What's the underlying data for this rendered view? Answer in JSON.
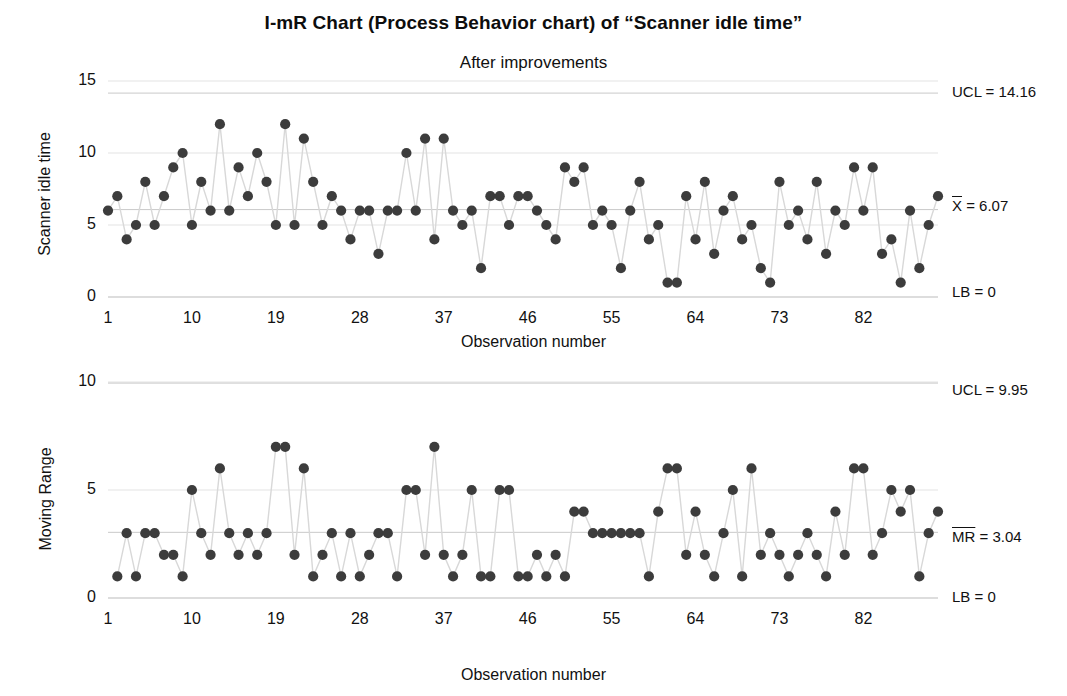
{
  "chart_title": "I-mR Chart (Process Behavior chart) of “Scanner idle time”",
  "chart_subtitle": "After improvements",
  "chart_data": [
    {
      "type": "line",
      "title": "Individuals chart",
      "xlabel": "Observation number",
      "ylabel": "Scanner idle time",
      "ylim": [
        0,
        15
      ],
      "yticks": [
        0,
        5,
        10,
        15
      ],
      "xticks": [
        1,
        10,
        19,
        28,
        37,
        46,
        55,
        64,
        73,
        82
      ],
      "xlim": [
        1,
        90
      ],
      "grid": true,
      "legend": "none",
      "marker": "filled-circle",
      "annotations": [
        {
          "label": "UCL = 14.16",
          "value": 14.16,
          "name": "upper-control-limit"
        },
        {
          "label": "X̄ = 6.07",
          "value": 6.07,
          "name": "center-line"
        },
        {
          "label": "LB = 0",
          "value": 0,
          "name": "lower-bound"
        }
      ],
      "x": [
        1,
        2,
        3,
        4,
        5,
        6,
        7,
        8,
        9,
        10,
        11,
        12,
        13,
        14,
        15,
        16,
        17,
        18,
        19,
        20,
        21,
        22,
        23,
        24,
        25,
        26,
        27,
        28,
        29,
        30,
        31,
        32,
        33,
        34,
        35,
        36,
        37,
        38,
        39,
        40,
        41,
        42,
        43,
        44,
        45,
        46,
        47,
        48,
        49,
        50,
        51,
        52,
        53,
        54,
        55,
        56,
        57,
        58,
        59,
        60,
        61,
        62,
        63,
        64,
        65,
        66,
        67,
        68,
        69,
        70,
        71,
        72,
        73,
        74,
        75,
        76,
        77,
        78,
        79,
        80,
        81,
        82,
        83,
        84,
        85,
        86,
        87,
        88,
        89,
        90
      ],
      "values": [
        6,
        7,
        4,
        5,
        8,
        5,
        7,
        9,
        10,
        5,
        8,
        6,
        12,
        6,
        9,
        7,
        10,
        8,
        5,
        12,
        5,
        11,
        8,
        5,
        7,
        6,
        4,
        6,
        6,
        3,
        6,
        6,
        10,
        6,
        11,
        4,
        11,
        6,
        5,
        6,
        2,
        7,
        7,
        5,
        7,
        7,
        6,
        5,
        4,
        9,
        8,
        9,
        5,
        6,
        5,
        2,
        6,
        8,
        4,
        5,
        1,
        1,
        7,
        4,
        8,
        3,
        6,
        7,
        4,
        5,
        2,
        1,
        8,
        5,
        6,
        4,
        8,
        3,
        6,
        5,
        9,
        6,
        9,
        3,
        4,
        1,
        6,
        2,
        5,
        7
      ]
    },
    {
      "type": "line",
      "title": "Moving range chart",
      "xlabel": "Observation number",
      "ylabel": "Moving Range",
      "ylim": [
        0,
        10
      ],
      "yticks": [
        0,
        5,
        10
      ],
      "xticks": [
        1,
        10,
        19,
        28,
        37,
        46,
        55,
        64,
        73,
        82
      ],
      "xlim": [
        1,
        90
      ],
      "grid": true,
      "legend": "none",
      "marker": "filled-circle",
      "annotations": [
        {
          "label": "UCL = 9.95",
          "value": 9.95,
          "name": "upper-control-limit"
        },
        {
          "label": "MR̄ = 3.04",
          "value": 3.04,
          "name": "center-line"
        },
        {
          "label": "LB = 0",
          "value": 0,
          "name": "lower-bound"
        }
      ],
      "x": [
        2,
        3,
        4,
        5,
        6,
        7,
        8,
        9,
        10,
        11,
        12,
        13,
        14,
        15,
        16,
        17,
        18,
        19,
        20,
        21,
        22,
        23,
        24,
        25,
        26,
        27,
        28,
        29,
        30,
        31,
        32,
        33,
        34,
        35,
        36,
        37,
        38,
        39,
        40,
        41,
        42,
        43,
        44,
        45,
        46,
        47,
        48,
        49,
        50,
        51,
        52,
        53,
        54,
        55,
        56,
        57,
        58,
        59,
        60,
        61,
        62,
        63,
        64,
        65,
        66,
        67,
        68,
        69,
        70,
        71,
        72,
        73,
        74,
        75,
        76,
        77,
        78,
        79,
        80,
        81,
        82,
        83,
        84,
        85,
        86,
        87,
        88,
        89,
        90
      ],
      "values": [
        1,
        3,
        1,
        3,
        3,
        2,
        2,
        1,
        5,
        3,
        2,
        6,
        3,
        2,
        3,
        2,
        3,
        7,
        7,
        2,
        6,
        1,
        2,
        3,
        1,
        3,
        1,
        2,
        3,
        3,
        1,
        5,
        5,
        2,
        7,
        2,
        1,
        2,
        5,
        1,
        1,
        5,
        5,
        1,
        1,
        2,
        1,
        2,
        1,
        4,
        4,
        3,
        3,
        3,
        3,
        3,
        3,
        1,
        4,
        6,
        6,
        2,
        4,
        2,
        1,
        3,
        5,
        1,
        6,
        2,
        3,
        2,
        1,
        2,
        3,
        2,
        1,
        4,
        2,
        6,
        6,
        2,
        3,
        5,
        4,
        5,
        1,
        3,
        4
      ]
    }
  ],
  "top_chart": {
    "ylabel": "Scanner idle time",
    "xlabel": "Observation number",
    "ytick_labels": [
      "15",
      "10",
      "5",
      "0"
    ],
    "xtick_labels": [
      "1",
      "10",
      "19",
      "28",
      "37",
      "46",
      "55",
      "64",
      "73",
      "82"
    ],
    "ucl_label": "UCL = 14.16",
    "center_prefix": "X",
    "center_suffix": " = 6.07",
    "lb_label": "LB = 0"
  },
  "bottom_chart": {
    "ylabel": "Moving Range",
    "xlabel": "Observation number",
    "ytick_labels": [
      "10",
      "5",
      "0"
    ],
    "xtick_labels": [
      "1",
      "10",
      "19",
      "28",
      "37",
      "46",
      "55",
      "64",
      "73",
      "82"
    ],
    "ucl_label": "UCL = 9.95",
    "center_prefix": "MR",
    "center_suffix": " = 3.04",
    "lb_label": "LB = 0"
  },
  "style": {
    "marker_color": "#3c3c3c",
    "line_color": "#d8d8d8",
    "grid_color": "#e3e3e3",
    "text_color": "#111111",
    "background": "#ffffff"
  }
}
